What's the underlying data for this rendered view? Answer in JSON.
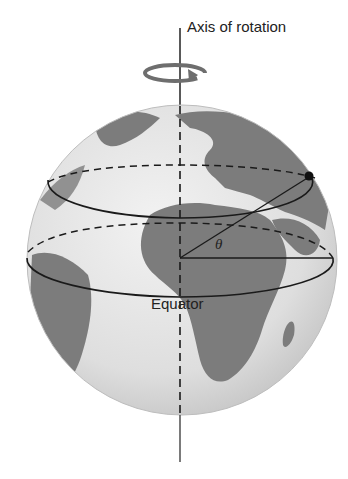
{
  "figure": {
    "type": "diagram",
    "labels": {
      "axis": "Axis of rotation",
      "equator": "Equator",
      "angle": "θ"
    },
    "elements": [
      "axis-of-rotation-line",
      "rotation-arrow",
      "globe",
      "latitude-circle",
      "equator-circle",
      "point-on-surface",
      "radius-to-point",
      "radius-in-equator-plane"
    ],
    "colors": {
      "ocean": "#e2e2e2",
      "land": "#7a7a7a",
      "lines": "#1a1a1a",
      "arrow": "#6e6e6e"
    }
  }
}
